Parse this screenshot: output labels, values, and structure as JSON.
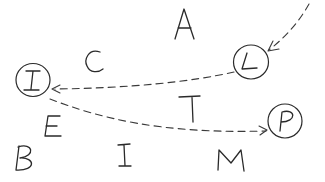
{
  "diagram": {
    "type": "hand-drawn letter graph",
    "circled_nodes": [
      {
        "id": "node-I",
        "label": "I",
        "cx": 33,
        "cy": 80,
        "r": 17
      },
      {
        "id": "node-L",
        "label": "L",
        "cx": 251,
        "cy": 62,
        "r": 17
      },
      {
        "id": "node-P",
        "label": "P",
        "cx": 285,
        "cy": 121,
        "r": 17
      }
    ],
    "loose_letters": [
      {
        "id": "letter-A",
        "label": "A",
        "x": 185,
        "y": 22
      },
      {
        "id": "letter-C",
        "label": "C",
        "x": 95,
        "y": 62
      },
      {
        "id": "letter-T",
        "label": "T",
        "x": 190,
        "y": 110
      },
      {
        "id": "letter-E",
        "label": "E",
        "x": 50,
        "y": 125
      },
      {
        "id": "letter-B",
        "label": "B",
        "x": 27,
        "y": 158
      },
      {
        "id": "letter-I2",
        "label": "I",
        "x": 125,
        "y": 155
      },
      {
        "id": "letter-M",
        "label": "M",
        "x": 230,
        "y": 160
      }
    ],
    "arrows": [
      {
        "from": "off-canvas top-right",
        "to": "L",
        "style": "dashed"
      },
      {
        "from": "L",
        "to": "I",
        "style": "dashed"
      },
      {
        "from": "I",
        "to": "P",
        "style": "dashed"
      }
    ]
  }
}
